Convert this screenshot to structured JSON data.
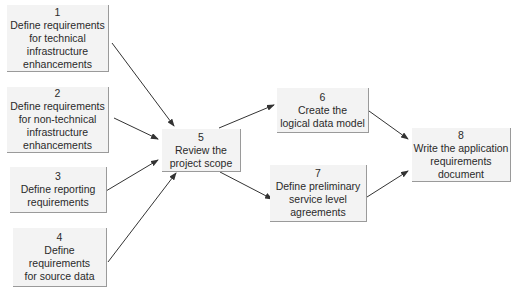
{
  "diagram": {
    "type": "flowchart",
    "nodes": [
      {
        "id": "1",
        "number": "1",
        "label": "Define requirements\nfor technical\ninfrastructure\nenhancements"
      },
      {
        "id": "2",
        "number": "2",
        "label": "Define requirements\nfor non-technical\ninfrastructure\nenhancements"
      },
      {
        "id": "3",
        "number": "3",
        "label": "Define reporting\nrequirements"
      },
      {
        "id": "4",
        "number": "4",
        "label": "Define\nrequirements\nfor source data"
      },
      {
        "id": "5",
        "number": "5",
        "label": "Review the\nproject scope"
      },
      {
        "id": "6",
        "number": "6",
        "label": "Create the\nlogical data model"
      },
      {
        "id": "7",
        "number": "7",
        "label": "Define preliminary\nservice level\nagreements"
      },
      {
        "id": "8",
        "number": "8",
        "label": "Write the application\nrequirements\ndocument"
      }
    ],
    "edges": [
      {
        "from": "1",
        "to": "5"
      },
      {
        "from": "2",
        "to": "5"
      },
      {
        "from": "3",
        "to": "5"
      },
      {
        "from": "4",
        "to": "5"
      },
      {
        "from": "5",
        "to": "6"
      },
      {
        "from": "5",
        "to": "7"
      },
      {
        "from": "6",
        "to": "8"
      },
      {
        "from": "7",
        "to": "8"
      }
    ],
    "colors": {
      "box_fill": "#f3f3f3",
      "box_shadow": "#9a9a9a",
      "arrow": "#333333",
      "text": "#2a2a2a"
    }
  }
}
